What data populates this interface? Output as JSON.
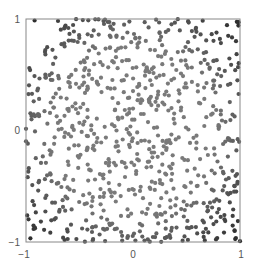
{
  "chart_data": {
    "type": "scatter",
    "title": "",
    "xlabel": "",
    "ylabel": "",
    "xlim": [
      -1,
      1
    ],
    "ylim": [
      -1,
      1
    ],
    "xticks": [
      -1,
      0,
      1
    ],
    "yticks": [
      -1,
      0,
      1
    ],
    "xtick_labels": [
      "−1",
      "0",
      "1"
    ],
    "ytick_labels": [
      "−1",
      "0",
      "1"
    ],
    "grid": false,
    "legend": null,
    "n_points": 800,
    "distribution": "uniform random in [-1,1] x [-1,1]",
    "color_encoding": "darker toward corners (distance from origin)",
    "colors": {
      "near": "#7a7a7a",
      "far": "#2e2e2e",
      "axes": "#888888"
    },
    "seed": 12345
  },
  "axes": {
    "frame": {
      "left": 26,
      "top": 19,
      "right": 240,
      "bottom": 242
    }
  }
}
